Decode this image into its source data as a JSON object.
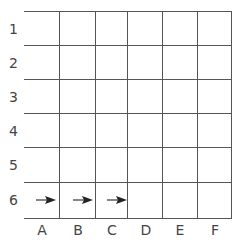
{
  "grid": {
    "rows": [
      "1",
      "2",
      "3",
      "4",
      "5",
      "6"
    ],
    "columns": [
      "A",
      "B",
      "C",
      "D",
      "E",
      "F"
    ],
    "line_color": "#555555",
    "label_color": "#444444"
  },
  "arrows": [
    {
      "row": "6",
      "column": "A",
      "direction": "right"
    },
    {
      "row": "6",
      "column": "B",
      "direction": "right"
    },
    {
      "row": "6",
      "column": "C",
      "direction": "right"
    }
  ]
}
